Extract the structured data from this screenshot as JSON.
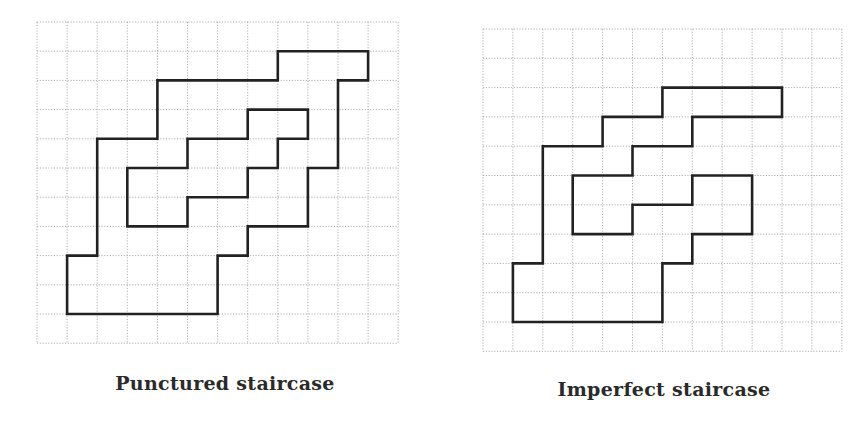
{
  "figures": [
    {
      "id": "punctured",
      "caption": "Punctured staircase",
      "grid": {
        "x0": 37,
        "y0": 22,
        "cell_w": 30.1,
        "cell_h": 29.2,
        "cols": 12,
        "rows": 11
      },
      "polygons": [
        {
          "name": "outer-boundary",
          "points": [
            [
              1,
              10
            ],
            [
              1,
              8
            ],
            [
              2,
              8
            ],
            [
              2,
              4
            ],
            [
              4,
              4
            ],
            [
              4,
              2
            ],
            [
              8,
              2
            ],
            [
              8,
              1
            ],
            [
              11,
              1
            ],
            [
              11,
              2
            ],
            [
              10,
              2
            ],
            [
              10,
              5
            ],
            [
              9,
              5
            ],
            [
              9,
              7
            ],
            [
              7,
              7
            ],
            [
              7,
              8
            ],
            [
              6,
              8
            ],
            [
              6,
              10
            ]
          ]
        },
        {
          "name": "inner-hole",
          "points": [
            [
              3,
              5
            ],
            [
              5,
              5
            ],
            [
              5,
              4
            ],
            [
              7,
              4
            ],
            [
              7,
              3
            ],
            [
              9,
              3
            ],
            [
              9,
              4
            ],
            [
              8,
              4
            ],
            [
              8,
              5
            ],
            [
              7,
              5
            ],
            [
              7,
              6
            ],
            [
              5,
              6
            ],
            [
              5,
              7
            ],
            [
              3,
              7
            ]
          ]
        }
      ],
      "caption_pos": {
        "x": 225,
        "y": 372
      }
    },
    {
      "id": "imperfect",
      "caption": "Imperfect staircase",
      "grid": {
        "x0": 483,
        "y0": 29,
        "cell_w": 29.9,
        "cell_h": 29.3,
        "cols": 12,
        "rows": 11
      },
      "polygons": [
        {
          "name": "boundary",
          "points": [
            [
              1,
              10
            ],
            [
              1,
              8
            ],
            [
              2,
              8
            ],
            [
              2,
              4
            ],
            [
              4,
              4
            ],
            [
              4,
              3
            ],
            [
              6,
              3
            ],
            [
              6,
              2
            ],
            [
              10,
              2
            ],
            [
              10,
              3
            ],
            [
              7,
              3
            ],
            [
              7,
              4
            ],
            [
              5,
              4
            ],
            [
              5,
              5
            ],
            [
              3,
              5
            ],
            [
              3,
              7
            ],
            [
              5,
              7
            ],
            [
              5,
              6
            ],
            [
              7,
              6
            ],
            [
              7,
              5
            ],
            [
              9,
              5
            ],
            [
              9,
              7
            ],
            [
              7,
              7
            ],
            [
              7,
              8
            ],
            [
              6,
              8
            ],
            [
              6,
              10
            ]
          ]
        }
      ],
      "caption_pos": {
        "x": 664,
        "y": 378
      }
    }
  ],
  "colors": {
    "grid": "#9a9a9a",
    "stroke": "#222222",
    "background": "#ffffff",
    "caption": "#2a2a2a"
  }
}
